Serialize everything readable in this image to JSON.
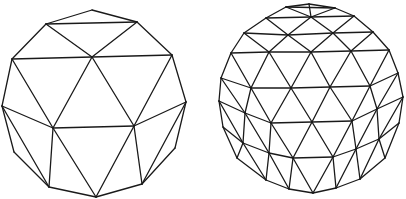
{
  "figure": {
    "stroke_color": "#1a1a1a",
    "background": "#ffffff"
  },
  "spheres": [
    {
      "name": "geodesic-sphere-low-frequency",
      "vertices": {
        "A": [
          92,
          10
        ],
        "B": [
          46,
          24
        ],
        "C": [
          137,
          22
        ],
        "D": [
          12,
          59
        ],
        "E": [
          92,
          57
        ],
        "F": [
          172,
          55
        ],
        "G": [
          2,
          106
        ],
        "H": [
          53,
          128
        ],
        "I": [
          134,
          126
        ],
        "J": [
          186,
          102
        ],
        "K": [
          14,
          152
        ],
        "L": [
          175,
          148
        ],
        "M": [
          49,
          187
        ],
        "N": [
          96,
          197
        ],
        "O": [
          142,
          184
        ]
      },
      "edges": [
        [
          "A",
          "B"
        ],
        [
          "A",
          "C"
        ],
        [
          "B",
          "C"
        ],
        [
          "B",
          "E"
        ],
        [
          "C",
          "E"
        ],
        [
          "B",
          "D"
        ],
        [
          "C",
          "F"
        ],
        [
          "D",
          "E"
        ],
        [
          "E",
          "F"
        ],
        [
          "D",
          "G"
        ],
        [
          "D",
          "H"
        ],
        [
          "E",
          "H"
        ],
        [
          "E",
          "I"
        ],
        [
          "F",
          "I"
        ],
        [
          "F",
          "J"
        ],
        [
          "G",
          "H"
        ],
        [
          "H",
          "I"
        ],
        [
          "I",
          "J"
        ],
        [
          "G",
          "K"
        ],
        [
          "G",
          "M"
        ],
        [
          "K",
          "M"
        ],
        [
          "H",
          "M"
        ],
        [
          "H",
          "N"
        ],
        [
          "I",
          "N"
        ],
        [
          "I",
          "O"
        ],
        [
          "J",
          "O"
        ],
        [
          "J",
          "L"
        ],
        [
          "L",
          "O"
        ],
        [
          "M",
          "N"
        ],
        [
          "N",
          "O"
        ]
      ]
    },
    {
      "name": "geodesic-sphere-high-frequency",
      "vertices": {
        "t0": [
          309,
          4
        ],
        "t1": [
          286,
          7
        ],
        "t2": [
          335,
          8
        ],
        "a0": [
          266,
          18
        ],
        "a1": [
          311,
          17
        ],
        "a2": [
          354,
          16
        ],
        "b0": [
          244,
          33
        ],
        "b1": [
          288,
          35
        ],
        "b2": [
          333,
          33
        ],
        "b3": [
          373,
          32
        ],
        "c0": [
          231,
          53
        ],
        "c1": [
          269,
          52
        ],
        "c2": [
          311,
          52
        ],
        "c3": [
          351,
          51
        ],
        "c4": [
          389,
          50
        ],
        "d0": [
          221,
          78
        ],
        "d1": [
          251,
          88
        ],
        "d2": [
          291,
          88
        ],
        "d3": [
          330,
          87
        ],
        "d4": [
          370,
          86
        ],
        "d5": [
          398,
          73
        ],
        "e0": [
          219,
          101
        ],
        "e1": [
          245,
          113
        ],
        "e2": [
          271,
          123
        ],
        "e3": [
          312,
          122
        ],
        "e4": [
          352,
          121
        ],
        "e5": [
          377,
          109
        ],
        "e6": [
          403,
          97
        ],
        "f0": [
          223,
          127
        ],
        "f1": [
          243,
          143
        ],
        "f2": [
          269,
          153
        ],
        "f3": [
          293,
          158
        ],
        "f4": [
          333,
          157
        ],
        "f5": [
          356,
          149
        ],
        "f6": [
          379,
          139
        ],
        "f7": [
          399,
          123
        ],
        "g0": [
          237,
          158
        ],
        "g1": [
          266,
          180
        ],
        "g2": [
          289,
          189
        ],
        "g3": [
          313,
          193
        ],
        "g4": [
          336,
          188
        ],
        "g5": [
          360,
          179
        ],
        "g6": [
          385,
          158
        ]
      },
      "edges": [
        [
          "t1",
          "t0"
        ],
        [
          "t0",
          "t2"
        ],
        [
          "t1",
          "a0"
        ],
        [
          "t1",
          "a1"
        ],
        [
          "t0",
          "a1"
        ],
        [
          "t2",
          "a1"
        ],
        [
          "t2",
          "a2"
        ],
        [
          "t1",
          "t2"
        ],
        [
          "a0",
          "a1"
        ],
        [
          "a1",
          "a2"
        ],
        [
          "a0",
          "b0"
        ],
        [
          "a0",
          "b1"
        ],
        [
          "a1",
          "b1"
        ],
        [
          "a1",
          "b2"
        ],
        [
          "a2",
          "b2"
        ],
        [
          "a2",
          "b3"
        ],
        [
          "b0",
          "b1"
        ],
        [
          "b1",
          "b2"
        ],
        [
          "b2",
          "b3"
        ],
        [
          "b0",
          "c0"
        ],
        [
          "b0",
          "c1"
        ],
        [
          "b1",
          "c1"
        ],
        [
          "b1",
          "c2"
        ],
        [
          "b2",
          "c2"
        ],
        [
          "b2",
          "c3"
        ],
        [
          "b3",
          "c3"
        ],
        [
          "b3",
          "c4"
        ],
        [
          "c0",
          "c1"
        ],
        [
          "c1",
          "c2"
        ],
        [
          "c2",
          "c3"
        ],
        [
          "c3",
          "c4"
        ],
        [
          "c0",
          "d0"
        ],
        [
          "c0",
          "d1"
        ],
        [
          "c1",
          "d1"
        ],
        [
          "c1",
          "d2"
        ],
        [
          "c2",
          "d2"
        ],
        [
          "c2",
          "d3"
        ],
        [
          "c3",
          "d3"
        ],
        [
          "c3",
          "d4"
        ],
        [
          "c4",
          "d4"
        ],
        [
          "c4",
          "d5"
        ],
        [
          "d0",
          "d1"
        ],
        [
          "d1",
          "d2"
        ],
        [
          "d2",
          "d3"
        ],
        [
          "d3",
          "d4"
        ],
        [
          "d4",
          "d5"
        ],
        [
          "d0",
          "e0"
        ],
        [
          "d0",
          "e1"
        ],
        [
          "d1",
          "e1"
        ],
        [
          "d1",
          "e2"
        ],
        [
          "d2",
          "e2"
        ],
        [
          "d2",
          "e3"
        ],
        [
          "d3",
          "e3"
        ],
        [
          "d3",
          "e4"
        ],
        [
          "d4",
          "e4"
        ],
        [
          "d4",
          "e5"
        ],
        [
          "d5",
          "e5"
        ],
        [
          "d5",
          "e6"
        ],
        [
          "e0",
          "e1"
        ],
        [
          "e1",
          "e2"
        ],
        [
          "e2",
          "e3"
        ],
        [
          "e3",
          "e4"
        ],
        [
          "e4",
          "e5"
        ],
        [
          "e5",
          "e6"
        ],
        [
          "e0",
          "f0"
        ],
        [
          "e0",
          "f1"
        ],
        [
          "e1",
          "f1"
        ],
        [
          "e1",
          "f2"
        ],
        [
          "e2",
          "f2"
        ],
        [
          "e2",
          "f3"
        ],
        [
          "e3",
          "f3"
        ],
        [
          "e3",
          "f4"
        ],
        [
          "e4",
          "f4"
        ],
        [
          "e4",
          "f5"
        ],
        [
          "e5",
          "f5"
        ],
        [
          "e5",
          "f6"
        ],
        [
          "e6",
          "f6"
        ],
        [
          "e6",
          "f7"
        ],
        [
          "f0",
          "f1"
        ],
        [
          "f1",
          "f2"
        ],
        [
          "f2",
          "f3"
        ],
        [
          "f3",
          "f4"
        ],
        [
          "f4",
          "f5"
        ],
        [
          "f5",
          "f6"
        ],
        [
          "f6",
          "f7"
        ],
        [
          "f0",
          "g0"
        ],
        [
          "f1",
          "g0"
        ],
        [
          "f1",
          "g1"
        ],
        [
          "f2",
          "g1"
        ],
        [
          "f2",
          "g2"
        ],
        [
          "f3",
          "g2"
        ],
        [
          "f3",
          "g3"
        ],
        [
          "f4",
          "g3"
        ],
        [
          "f4",
          "g4"
        ],
        [
          "f5",
          "g4"
        ],
        [
          "f5",
          "g5"
        ],
        [
          "f6",
          "g5"
        ],
        [
          "f6",
          "g6"
        ],
        [
          "f7",
          "g6"
        ],
        [
          "g0",
          "g1"
        ],
        [
          "g1",
          "g2"
        ],
        [
          "g2",
          "g3"
        ],
        [
          "g3",
          "g4"
        ],
        [
          "g4",
          "g5"
        ],
        [
          "g5",
          "g6"
        ]
      ]
    }
  ]
}
